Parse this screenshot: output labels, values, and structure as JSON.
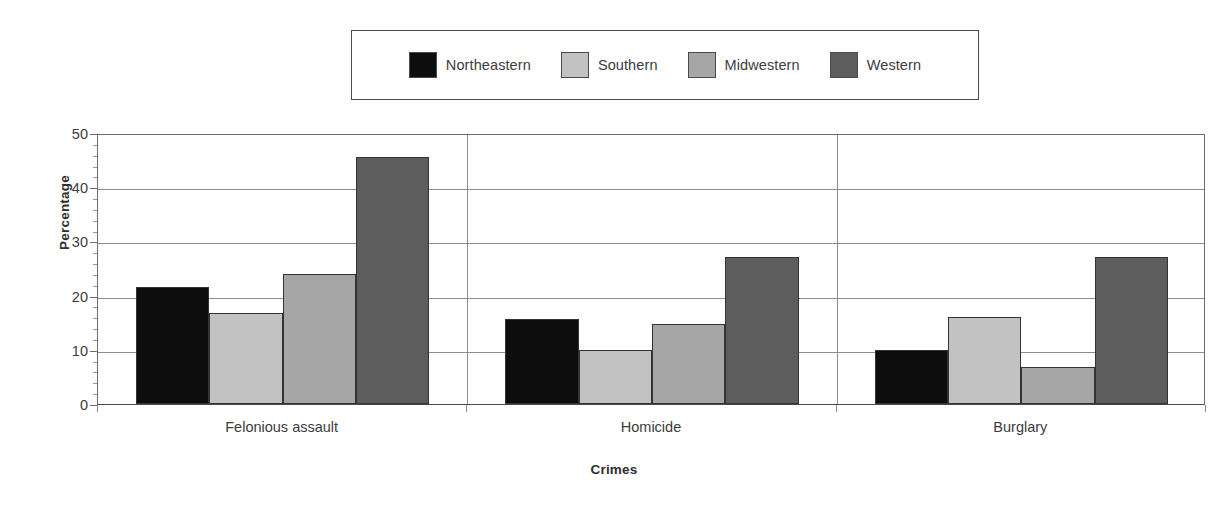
{
  "chart_data": {
    "type": "bar",
    "title": "",
    "xlabel": "Crimes",
    "ylabel": "Percentage",
    "categories": [
      "Felonious assault",
      "Homicide",
      "Burglary"
    ],
    "series": [
      {
        "name": "Northeastern",
        "color": "#0d0d0d",
        "values": [
          21.6,
          15.6,
          9.9
        ]
      },
      {
        "name": "Southern",
        "color": "#c2c2c2",
        "values": [
          16.8,
          9.9,
          16.0
        ]
      },
      {
        "name": "Midwestern",
        "color": "#a6a6a6",
        "values": [
          23.9,
          14.8,
          6.8
        ]
      },
      {
        "name": "Western",
        "color": "#5d5d5d",
        "values": [
          45.5,
          27.2,
          27.1
        ]
      }
    ],
    "ylim": [
      0,
      50
    ],
    "yticks": [
      0,
      10,
      20,
      30,
      40,
      50
    ],
    "ytick_labels": [
      "0",
      "10",
      "20",
      "30",
      "40",
      "50"
    ],
    "yminor_interval": 2,
    "grid": "horizontal",
    "legend_position": "top-center",
    "legend_border_color": "#4a4a4a",
    "gridline_color": "#8d8d8d",
    "axis_color": "#4a4a4a",
    "bar_edge_color": "#333333",
    "background": "#ffffff"
  },
  "legend": {
    "entries": [
      {
        "label": "Northeastern"
      },
      {
        "label": "Southern"
      },
      {
        "label": "Midwestern"
      },
      {
        "label": "Western"
      }
    ]
  },
  "axes": {
    "y_title": "Percentage",
    "x_title": "Crimes",
    "y_tick_0": "0",
    "y_tick_1": "10",
    "y_tick_2": "20",
    "y_tick_3": "30",
    "y_tick_4": "40",
    "y_tick_5": "50",
    "x_cat_0": "Felonious assault",
    "x_cat_1": "Homicide",
    "x_cat_2": "Burglary"
  }
}
